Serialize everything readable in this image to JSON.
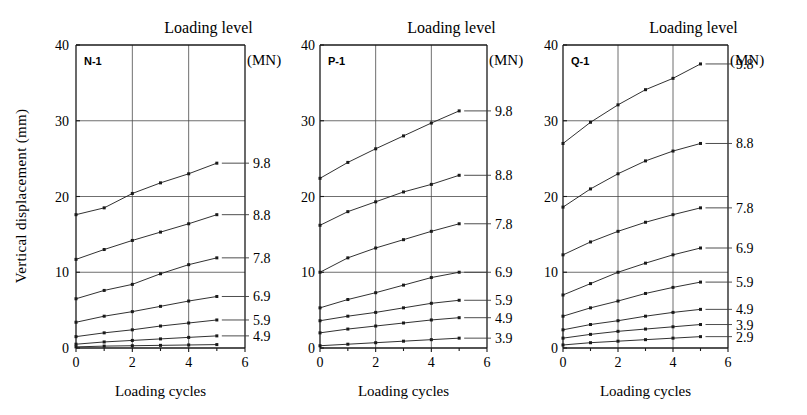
{
  "figure": {
    "ylabel": "Vertical displacement  (mm)",
    "header_title": "Loading level",
    "header_unit": "(MN)",
    "xlabel": "Loading cycles"
  },
  "chart_data": [
    {
      "type": "line",
      "title": "N-1",
      "xlabel": "Loading cycles",
      "ylabel": "Vertical displacement  (mm)",
      "xlim": [
        0,
        6
      ],
      "ylim": [
        0,
        40
      ],
      "xticks": [
        0,
        2,
        4,
        6
      ],
      "yticks": [
        0,
        10,
        20,
        30,
        40
      ],
      "grid": true,
      "legend_position": "right",
      "legend_title": "Loading level (MN)",
      "x": [
        0,
        1,
        2,
        3,
        4,
        5
      ],
      "series": [
        {
          "name": "9.8",
          "values": [
            17.6,
            18.5,
            20.4,
            21.8,
            23.0,
            24.4
          ]
        },
        {
          "name": "8.8",
          "values": [
            11.7,
            13.0,
            14.2,
            15.3,
            16.4,
            17.6
          ]
        },
        {
          "name": "7.8",
          "values": [
            6.5,
            7.6,
            8.4,
            9.8,
            11.0,
            11.9
          ]
        },
        {
          "name": "6.9",
          "values": [
            3.4,
            4.2,
            4.8,
            5.5,
            6.2,
            6.8
          ]
        },
        {
          "name": "5.9",
          "values": [
            1.5,
            2.0,
            2.4,
            2.9,
            3.3,
            3.7
          ]
        },
        {
          "name": "4.9",
          "values": [
            0.5,
            0.8,
            1.0,
            1.2,
            1.4,
            1.6
          ]
        },
        {
          "name": "",
          "values": [
            0.15,
            0.25,
            0.3,
            0.35,
            0.4,
            0.45
          ]
        }
      ]
    },
    {
      "type": "line",
      "title": "P-1",
      "xlabel": "Loading cycles",
      "ylabel": "Vertical displacement  (mm)",
      "xlim": [
        0,
        6
      ],
      "ylim": [
        0,
        40
      ],
      "xticks": [
        0,
        2,
        4,
        6
      ],
      "yticks": [
        0,
        10,
        20,
        30,
        40
      ],
      "grid": true,
      "legend_position": "right",
      "legend_title": "Loading level (MN)",
      "x": [
        0,
        1,
        2,
        3,
        4,
        5
      ],
      "series": [
        {
          "name": "9.8",
          "values": [
            22.4,
            24.5,
            26.3,
            28.0,
            29.7,
            31.3
          ]
        },
        {
          "name": "8.8",
          "values": [
            16.2,
            18.0,
            19.3,
            20.6,
            21.6,
            22.8
          ]
        },
        {
          "name": "7.8",
          "values": [
            10.0,
            11.9,
            13.2,
            14.3,
            15.4,
            16.4
          ]
        },
        {
          "name": "6.9",
          "values": [
            5.3,
            6.4,
            7.3,
            8.3,
            9.3,
            10.0
          ]
        },
        {
          "name": "5.9",
          "values": [
            3.6,
            4.2,
            4.7,
            5.3,
            5.9,
            6.3
          ]
        },
        {
          "name": "4.9",
          "values": [
            2.0,
            2.5,
            2.9,
            3.3,
            3.7,
            4.0
          ]
        },
        {
          "name": "3.9",
          "values": [
            0.3,
            0.5,
            0.7,
            0.9,
            1.1,
            1.3
          ]
        }
      ]
    },
    {
      "type": "line",
      "title": "Q-1",
      "xlabel": "Loading cycles",
      "ylabel": "Vertical displacement  (mm)",
      "xlim": [
        0,
        6
      ],
      "ylim": [
        0,
        40
      ],
      "xticks": [
        0,
        2,
        4,
        6
      ],
      "yticks": [
        0,
        10,
        20,
        30,
        40
      ],
      "grid": true,
      "legend_position": "right",
      "legend_title": "Loading level (MN)",
      "x": [
        0,
        1,
        2,
        3,
        4,
        5
      ],
      "series": [
        {
          "name": "9.8",
          "values": [
            27.0,
            29.8,
            32.1,
            34.1,
            35.6,
            37.5
          ]
        },
        {
          "name": "8.8",
          "values": [
            18.6,
            21.0,
            23.0,
            24.7,
            26.0,
            27.0
          ]
        },
        {
          "name": "7.8",
          "values": [
            12.3,
            14.0,
            15.4,
            16.6,
            17.6,
            18.5
          ]
        },
        {
          "name": "6.9",
          "values": [
            7.0,
            8.5,
            10.0,
            11.2,
            12.3,
            13.2
          ]
        },
        {
          "name": "5.9",
          "values": [
            4.2,
            5.3,
            6.2,
            7.2,
            8.0,
            8.7
          ]
        },
        {
          "name": "4.9",
          "values": [
            2.4,
            3.1,
            3.6,
            4.2,
            4.7,
            5.1
          ]
        },
        {
          "name": "3.9",
          "values": [
            1.3,
            1.8,
            2.2,
            2.5,
            2.8,
            3.1
          ]
        },
        {
          "name": "2.9",
          "values": [
            0.4,
            0.7,
            0.9,
            1.1,
            1.3,
            1.5
          ]
        }
      ]
    }
  ]
}
